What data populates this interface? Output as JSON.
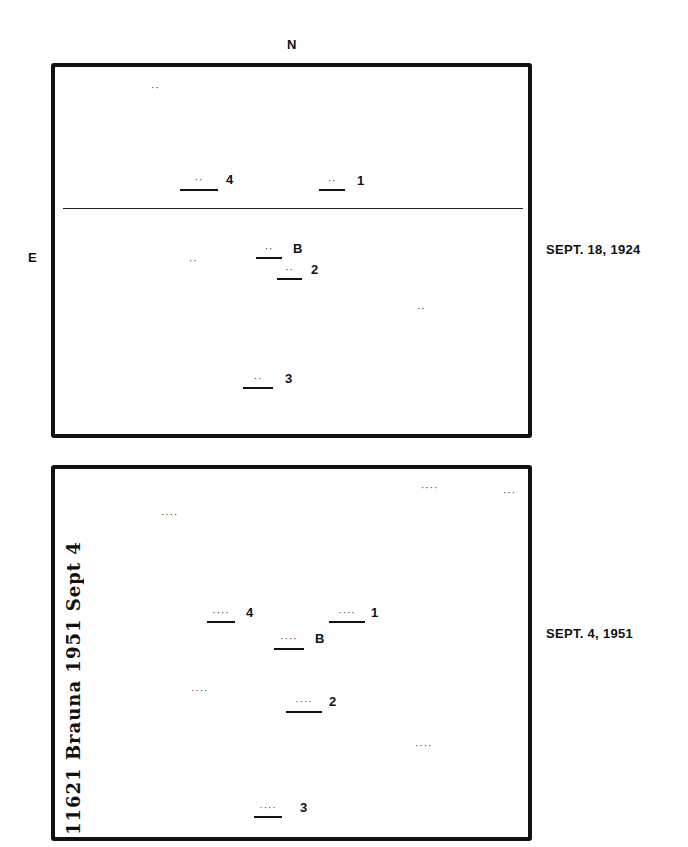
{
  "compass": {
    "north": "N",
    "east": "E"
  },
  "panels": [
    {
      "id": "top",
      "date_label": "SEPT. 18, 1924",
      "has_divider_line": true,
      "marked_objects": [
        {
          "label": "4",
          "dots": "··"
        },
        {
          "label": "1",
          "dots": "··"
        },
        {
          "label": "B",
          "dots": "··"
        },
        {
          "label": "2",
          "dots": "··"
        },
        {
          "label": "3",
          "dots": "··"
        }
      ],
      "field_stars": [
        "··",
        "··",
        "··"
      ]
    },
    {
      "id": "bottom",
      "date_label": "SEPT. 4, 1951",
      "has_divider_line": false,
      "handwritten_annotation": "11621  Brauna  1951 Sept 4",
      "marked_objects": [
        {
          "label": "4",
          "dots": "····"
        },
        {
          "label": "1",
          "dots": "····"
        },
        {
          "label": "B",
          "dots": "····"
        },
        {
          "label": "2",
          "dots": "····"
        },
        {
          "label": "3",
          "dots": "····"
        }
      ],
      "field_stars": [
        "····",
        "···",
        "····",
        "····",
        "····"
      ]
    }
  ]
}
